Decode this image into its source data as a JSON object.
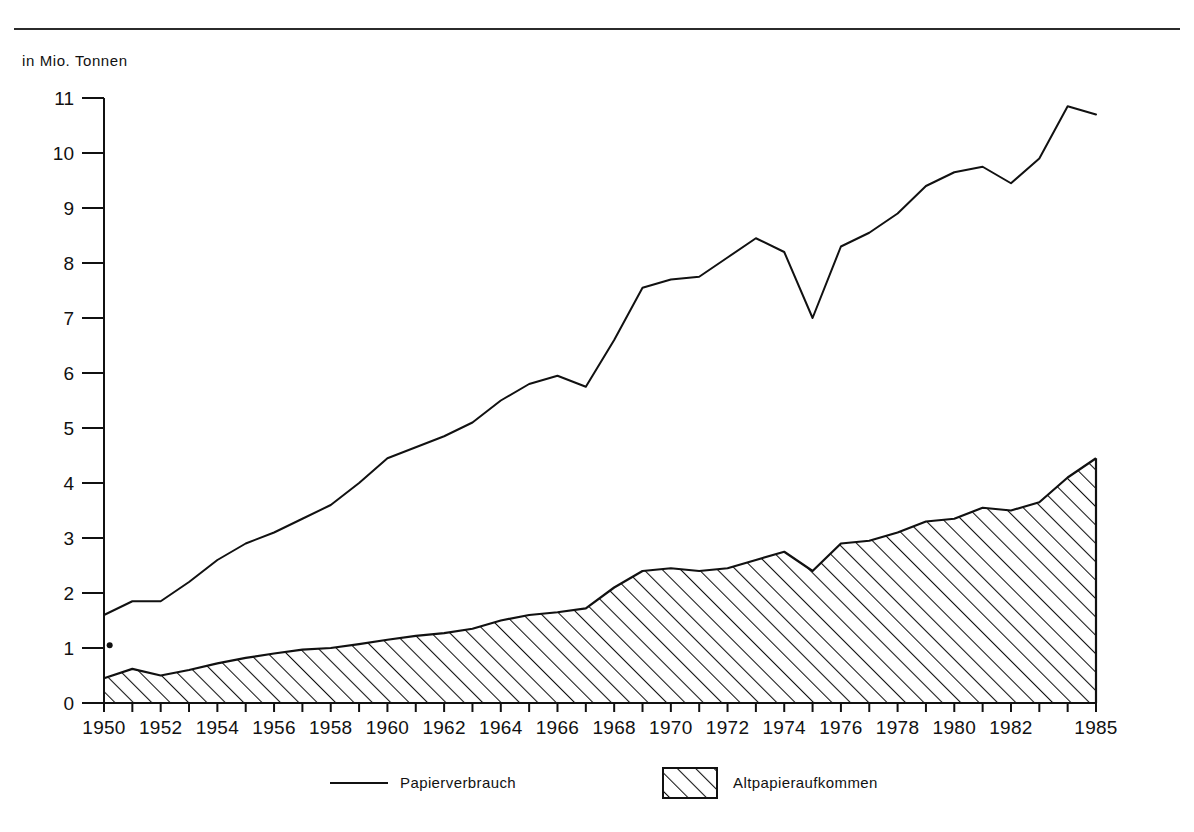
{
  "figure": {
    "unit_label": "in Mio. Tonnen",
    "has_top_rule": true
  },
  "legend": {
    "items": [
      {
        "key": "line",
        "label": "Papierverbrauch",
        "marker": "line-swatch"
      },
      {
        "key": "area",
        "label": "Altpapieraufkommen",
        "marker": "hatched-swatch"
      }
    ]
  },
  "colors": {
    "ink": "#111111",
    "rule": "#2b2b2b",
    "background": "#ffffff"
  },
  "chart_data": {
    "type": "area",
    "title": "",
    "subtitle": "",
    "xlabel": "",
    "ylabel": "in Mio. Tonnen",
    "xlim": [
      1950,
      1985
    ],
    "ylim": [
      0,
      11
    ],
    "yticks": [
      0,
      1,
      2,
      3,
      4,
      5,
      6,
      7,
      8,
      9,
      10,
      11
    ],
    "ytick_labels": [
      "0",
      "1",
      "2",
      "3",
      "4",
      "5",
      "6",
      "7",
      "8",
      "9",
      "10",
      "11"
    ],
    "xticks": [
      1950,
      1952,
      1954,
      1956,
      1958,
      1960,
      1962,
      1964,
      1966,
      1968,
      1970,
      1972,
      1974,
      1976,
      1978,
      1980,
      1982,
      1985
    ],
    "xtick_labels": [
      "1950",
      "1952",
      "1954",
      "1956",
      "1958",
      "1960",
      "1962",
      "1964",
      "1966",
      "1968",
      "1970",
      "1972",
      "1974",
      "1976",
      "1978",
      "1980",
      "1982",
      "1985"
    ],
    "minor_xticks_every": 1,
    "grid": false,
    "legend_position": "bottom",
    "x": [
      1950,
      1951,
      1952,
      1953,
      1954,
      1955,
      1956,
      1957,
      1958,
      1959,
      1960,
      1961,
      1962,
      1963,
      1964,
      1965,
      1966,
      1967,
      1968,
      1969,
      1970,
      1971,
      1972,
      1973,
      1974,
      1975,
      1976,
      1977,
      1978,
      1979,
      1980,
      1981,
      1982,
      1983,
      1984,
      1985
    ],
    "series": [
      {
        "name": "Papierverbrauch",
        "style": "line",
        "values": [
          1.6,
          1.85,
          1.85,
          2.2,
          2.6,
          2.9,
          3.1,
          3.35,
          3.6,
          4.0,
          4.45,
          4.65,
          4.85,
          5.1,
          5.5,
          5.8,
          5.95,
          5.75,
          6.6,
          7.55,
          7.7,
          7.75,
          8.1,
          8.45,
          8.2,
          7.0,
          8.3,
          8.55,
          8.9,
          9.4,
          9.65,
          9.75,
          9.45,
          9.9,
          10.85,
          10.7
        ]
      },
      {
        "name": "Altpapieraufkommen",
        "style": "hatched-area",
        "values": [
          0.45,
          0.62,
          0.5,
          0.6,
          0.72,
          0.82,
          0.9,
          0.97,
          1.0,
          1.07,
          1.15,
          1.22,
          1.27,
          1.35,
          1.5,
          1.6,
          1.65,
          1.72,
          2.1,
          2.4,
          2.45,
          2.4,
          2.45,
          2.6,
          2.75,
          2.4,
          2.9,
          2.95,
          3.1,
          3.3,
          3.35,
          3.55,
          3.5,
          3.65,
          4.1,
          4.45
        ]
      }
    ],
    "annotations": [
      {
        "type": "point-mark",
        "x": 1950.2,
        "y": 1.05,
        "label": ""
      }
    ]
  }
}
